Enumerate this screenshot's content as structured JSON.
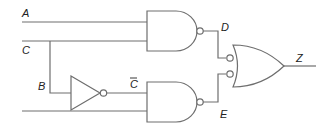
{
  "diagram": {
    "type": "logic-circuit",
    "labels": {
      "input_a": "A",
      "input_c": "C",
      "branch_b": "B",
      "not_c": "C",
      "node_d": "D",
      "node_e": "E",
      "output_z": "Z"
    },
    "gates": [
      {
        "id": "nand-top",
        "type": "NAND",
        "inputs": [
          "A",
          "C"
        ],
        "output": "D"
      },
      {
        "id": "not",
        "type": "NOT",
        "inputs": [
          "B"
        ],
        "output": "C̄"
      },
      {
        "id": "nand-bottom",
        "type": "NAND",
        "inputs": [
          "C̄",
          "unlabeled"
        ],
        "output": "E"
      },
      {
        "id": "or-inverted",
        "type": "OR (inverted inputs)",
        "inputs": [
          "D",
          "E"
        ],
        "output": "Z"
      }
    ],
    "colors": {
      "line": "#6e6e6e",
      "text": "#222222",
      "background": "#ffffff"
    }
  }
}
